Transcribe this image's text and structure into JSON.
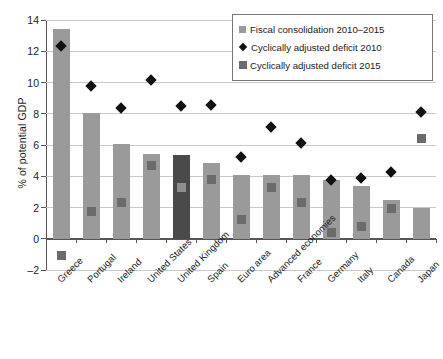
{
  "chart_data": {
    "type": "bar",
    "title": "",
    "xlabel": "",
    "ylabel": "% of potential GDP",
    "ylim": [
      -2,
      14
    ],
    "ytick_step": 2,
    "yticks": [
      -2,
      0,
      2,
      4,
      6,
      8,
      10,
      12,
      14
    ],
    "grid": true,
    "legend_position": "top-right",
    "categories": [
      "Greece",
      "Portugal",
      "Ireland",
      "United States",
      "United Kingdom",
      "Spain",
      "Euro area",
      "Advanced economies",
      "France",
      "Germany",
      "Italy",
      "Canada",
      "Japan"
    ],
    "series": [
      {
        "name": "Fiscal consolidation 2010–2015",
        "type": "bar",
        "color": "#9a9a9a",
        "highlight_color": "#4a4a4a",
        "highlight_category": "United Kingdom",
        "values": [
          13.4,
          8.05,
          6.05,
          5.45,
          5.35,
          4.85,
          4.1,
          4.1,
          4.1,
          3.75,
          3.4,
          2.5,
          1.95
        ]
      },
      {
        "name": "Cyclically adjusted deficit 2010",
        "type": "marker-diamond",
        "color": "#111111",
        "values": [
          12.35,
          9.75,
          8.35,
          10.15,
          8.5,
          8.55,
          5.25,
          7.15,
          6.15,
          3.75,
          3.9,
          4.25,
          8.1
        ]
      },
      {
        "name": "Cyclically adjusted deficit 2015",
        "type": "marker-square",
        "color": "#6b6b6b",
        "values": [
          -1.1,
          1.75,
          2.3,
          4.7,
          3.25,
          3.8,
          1.25,
          3.25,
          2.3,
          0.4,
          0.8,
          1.95,
          6.4
        ]
      }
    ]
  },
  "legend": {
    "items": [
      {
        "label": "Fiscal consolidation 2010–2015",
        "marker": "square-light"
      },
      {
        "label": "Cyclically adjusted deficit 2010",
        "marker": "diamond-black"
      },
      {
        "label": "Cyclically adjusted deficit 2015",
        "marker": "square-dark"
      }
    ]
  },
  "colors": {
    "bar": "#9a9a9a",
    "bar_highlight": "#4a4a4a",
    "marker_2015": "#6b6b6b",
    "marker_2010": "#111111",
    "gridline": "#c9c9c9",
    "axis": "#555555"
  }
}
